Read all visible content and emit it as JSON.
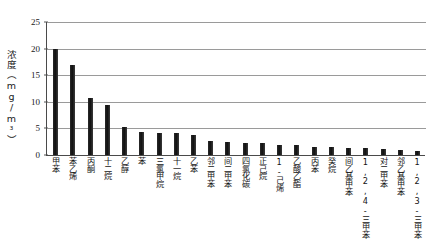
{
  "chart_data": {
    "type": "bar",
    "title": "",
    "xlabel": "",
    "ylabel": "浓度（mg/m³）",
    "ylim": [
      0,
      25
    ],
    "yticks": [
      0,
      5,
      10,
      15,
      20,
      25
    ],
    "grid": true,
    "legend": "none",
    "bar_color": "#1c1c1c",
    "categories": [
      "甲苯",
      "苯乙烯",
      "丙酮",
      "十二烷",
      "乙醇",
      "苯",
      "三氯甲烷",
      "十一烷",
      "乙苯",
      "邻二甲苯",
      "间二甲苯",
      "四氯化碳",
      "正己烷",
      "1-己烯",
      "乙酸乙酯",
      "丙苯",
      "癸烷",
      "间乙基甲苯",
      "1,2,4-三甲苯",
      "对二甲苯",
      "邻乙基甲苯",
      "1,2,3-三甲苯"
    ],
    "values": [
      19.9,
      17.0,
      10.7,
      9.4,
      5.3,
      4.3,
      4.2,
      4.1,
      3.8,
      2.6,
      2.5,
      2.3,
      2.2,
      1.9,
      1.8,
      1.6,
      1.5,
      1.4,
      1.3,
      1.2,
      1.0,
      0.8
    ]
  }
}
